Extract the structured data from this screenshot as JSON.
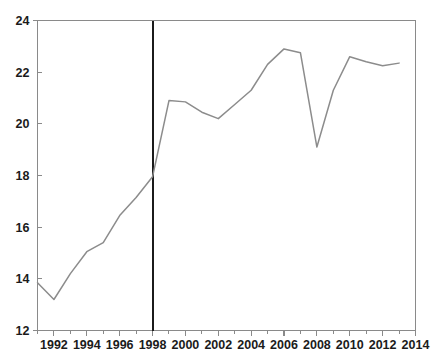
{
  "chart_data": {
    "type": "line",
    "title": "",
    "subtitle": "",
    "xlabel": "",
    "ylabel": "",
    "xlim": [
      1991,
      2014
    ],
    "ylim": [
      12,
      24
    ],
    "grid": false,
    "legend": null,
    "legend_position": "none",
    "x_ticks": [
      1992,
      1994,
      1996,
      1998,
      2000,
      2002,
      2004,
      2006,
      2008,
      2010,
      2012,
      2014
    ],
    "x_tick_labels": [
      "1992",
      "1994",
      "1996",
      "1998",
      "2000",
      "2002",
      "2004",
      "2006",
      "2008",
      "2010",
      "2012",
      "2014"
    ],
    "x_minor_ticks": [
      1991,
      1993,
      1995,
      1997,
      1999,
      2001,
      2003,
      2005,
      2007,
      2009,
      2011,
      2013
    ],
    "y_ticks": [
      12,
      14,
      16,
      18,
      20,
      22,
      24
    ],
    "y_tick_labels": [
      "12",
      "14",
      "16",
      "18",
      "20",
      "22",
      "24"
    ],
    "x": [
      1991,
      1992,
      1993,
      1994,
      1995,
      1996,
      1997,
      1998,
      1999,
      2000,
      2001,
      2002,
      2003,
      2004,
      2005,
      2006,
      2007,
      2008,
      2009,
      2010,
      2011,
      2012,
      2013
    ],
    "values": [
      13.85,
      13.2,
      14.2,
      15.05,
      15.4,
      16.45,
      17.15,
      17.95,
      20.9,
      20.85,
      20.45,
      20.2,
      20.75,
      21.3,
      22.3,
      22.9,
      22.75,
      19.1,
      21.3,
      22.6,
      22.4,
      22.25,
      22.35
    ],
    "series": [
      {
        "name": "series-1",
        "color": "#8c8c8c",
        "values": [
          13.85,
          13.2,
          14.2,
          15.05,
          15.4,
          16.45,
          17.15,
          17.95,
          20.9,
          20.85,
          20.45,
          20.2,
          20.75,
          21.3,
          22.3,
          22.9,
          22.75,
          19.1,
          21.3,
          22.6,
          22.4,
          22.25,
          22.35
        ]
      }
    ],
    "annotations": [
      {
        "type": "vertical-reference-line",
        "name": "reference-line-1998",
        "x": 1998,
        "color": "#1b1b1b",
        "label": ""
      }
    ],
    "colors": {
      "line": "#8c8c8c",
      "axis": "#8a8a8a",
      "reference_line": "#1b1b1b",
      "text": "#1b1b1b",
      "background": "#ffffff"
    }
  }
}
